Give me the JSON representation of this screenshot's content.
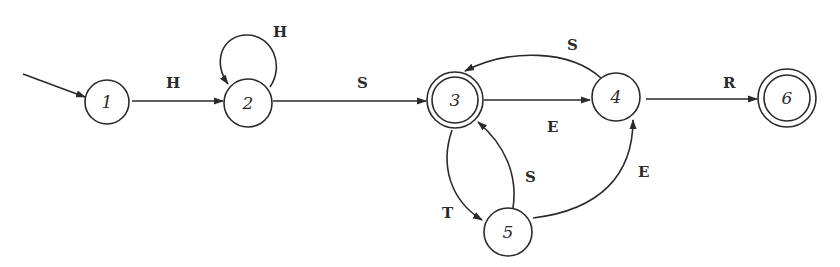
{
  "diagram": {
    "type": "finite-state-automaton",
    "start_state": "1",
    "states": [
      {
        "id": "1",
        "label": "1",
        "accepting": false,
        "cx": 107,
        "cy": 102
      },
      {
        "id": "2",
        "label": "2",
        "accepting": false,
        "cx": 248,
        "cy": 103
      },
      {
        "id": "3",
        "label": "3",
        "accepting": true,
        "cx": 455,
        "cy": 100
      },
      {
        "id": "4",
        "label": "4",
        "accepting": false,
        "cx": 616,
        "cy": 97
      },
      {
        "id": "5",
        "label": "5",
        "accepting": false,
        "cx": 508,
        "cy": 232
      },
      {
        "id": "6",
        "label": "6",
        "accepting": true,
        "cx": 787,
        "cy": 98
      }
    ],
    "transitions": [
      {
        "from": "1",
        "to": "2",
        "label": "H"
      },
      {
        "from": "2",
        "to": "2",
        "label": "H"
      },
      {
        "from": "2",
        "to": "3",
        "label": "S"
      },
      {
        "from": "3",
        "to": "4",
        "label": "E"
      },
      {
        "from": "4",
        "to": "3",
        "label": "S"
      },
      {
        "from": "3",
        "to": "5",
        "label": "T"
      },
      {
        "from": "5",
        "to": "3",
        "label": "S"
      },
      {
        "from": "5",
        "to": "4",
        "label": "E"
      },
      {
        "from": "4",
        "to": "6",
        "label": "R"
      }
    ]
  }
}
